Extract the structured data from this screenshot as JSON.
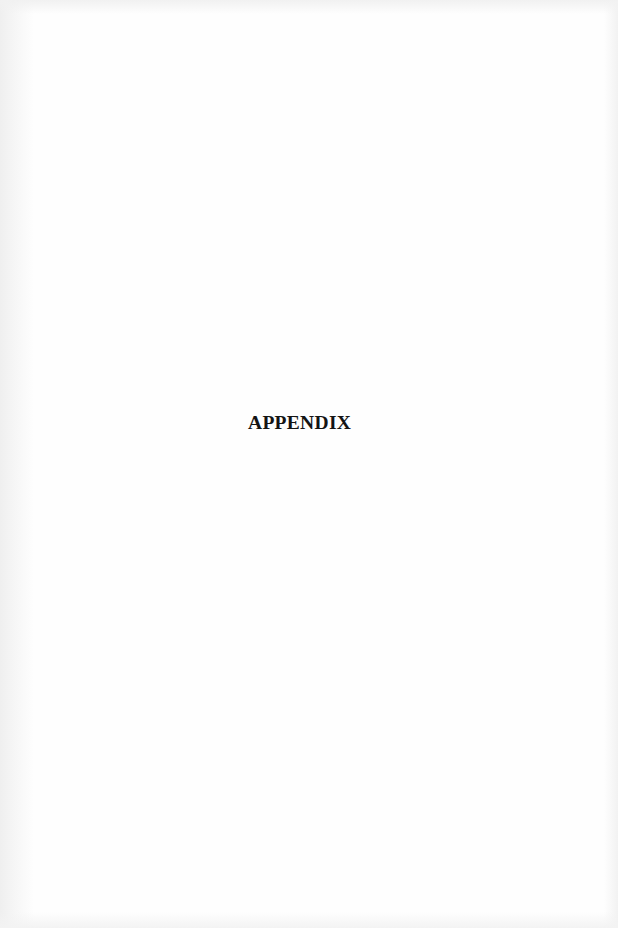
{
  "page": {
    "heading": "APPENDIX"
  },
  "colors": {
    "background": "#fefefe",
    "text": "#141414"
  }
}
